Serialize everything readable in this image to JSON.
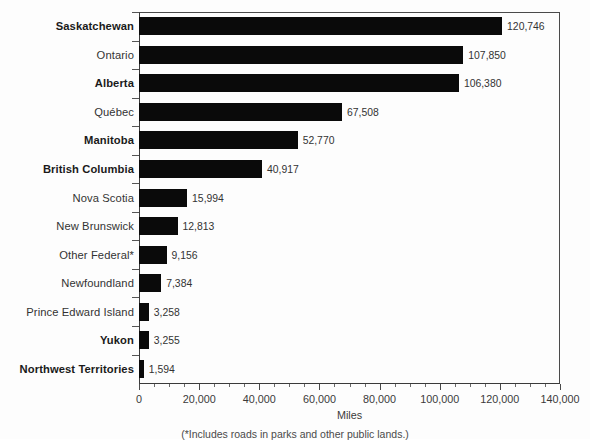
{
  "chart_data": {
    "type": "bar",
    "orientation": "horizontal",
    "title": "",
    "xlabel": "Miles",
    "ylabel": "",
    "xlim": [
      0,
      140000
    ],
    "xtick_step": 20000,
    "xminor_step": 5000,
    "grid": false,
    "legend": null,
    "categories": [
      "Saskatchewan",
      "Ontario",
      "Alberta",
      "Québec",
      "Manitoba",
      "British Columbia",
      "Nova Scotia",
      "New Brunswick",
      "Other Federal*",
      "Newfoundland",
      "Prince Edward Island",
      "Yukon",
      "Northwest Territories"
    ],
    "values": [
      120746,
      107850,
      106380,
      67508,
      52770,
      40917,
      15994,
      12813,
      9156,
      7384,
      3258,
      3255,
      1594
    ],
    "value_labels": [
      "120,746",
      "107,850",
      "106,380",
      "67,508",
      "52,770",
      "40,917",
      "15,994",
      "12,813",
      "9,156",
      "7,384",
      "3,258",
      "3,255",
      "1,594"
    ],
    "category_bold": [
      true,
      false,
      true,
      false,
      true,
      true,
      false,
      false,
      false,
      false,
      false,
      true,
      true
    ],
    "xtick_labels": [
      "0",
      "20,000",
      "40,000",
      "60,000",
      "80,000",
      "100,000",
      "120,000",
      "140,000"
    ],
    "xtick_values": [
      0,
      20000,
      40000,
      60000,
      80000,
      100000,
      120000,
      140000
    ],
    "bar_color": "#0a0a0a",
    "axis_color": "#3a3a3a",
    "background_color": "#fdfdfd"
  },
  "footnote": "(*Includes roads in parks and other public lands.)"
}
